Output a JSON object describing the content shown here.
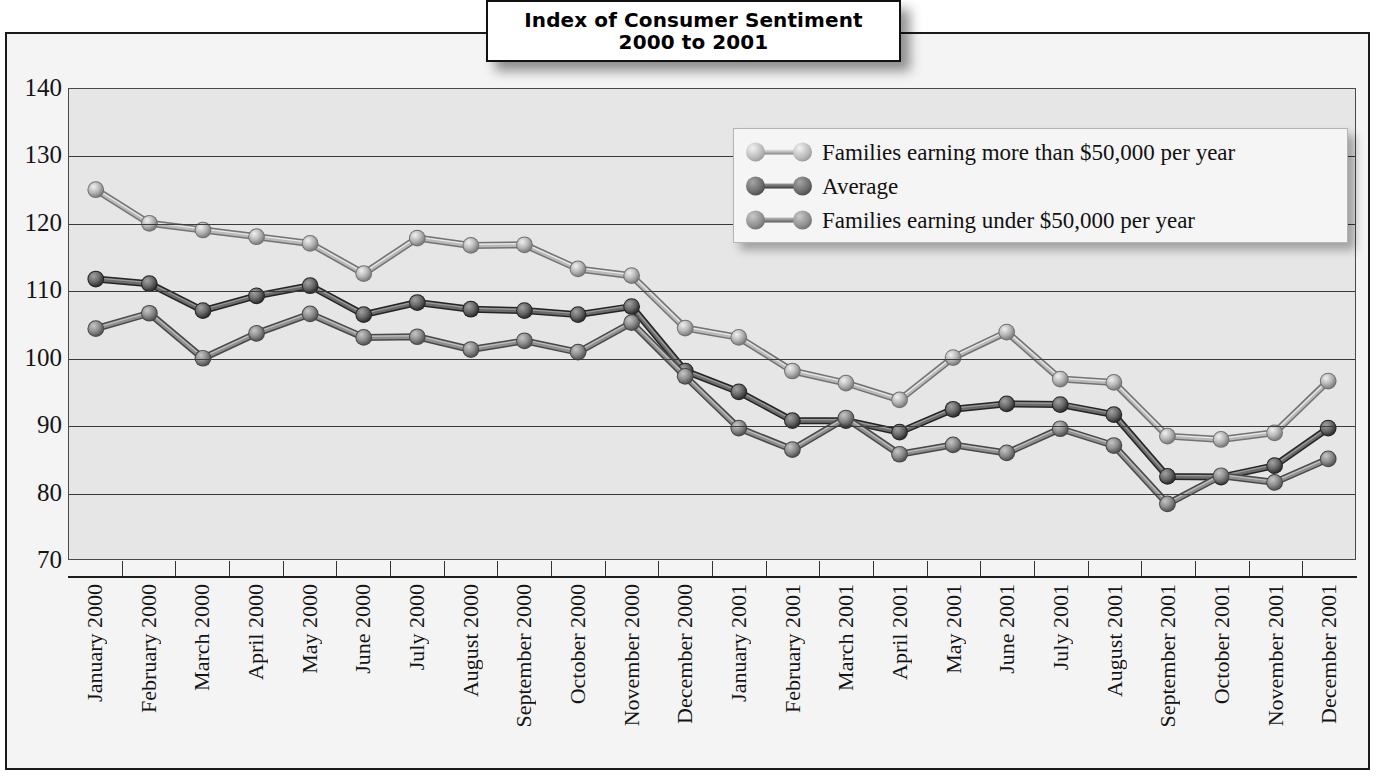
{
  "title": {
    "line1": "Index of Consumer Sentiment",
    "line2": "2000 to 2001"
  },
  "legend": {
    "position": "top-right-inside-plot",
    "items": [
      {
        "label": "Families earning more than $50,000 per year",
        "color": "#b9b9b9",
        "key": "above_50k"
      },
      {
        "label": "Average",
        "color": "#6b6b6b",
        "key": "average"
      },
      {
        "label": "Families earning under $50,000 per year",
        "color": "#8f8f8f",
        "key": "under_50k"
      }
    ]
  },
  "axes": {
    "y_ticks": [
      "140",
      "130",
      "120",
      "110",
      "100",
      "90",
      "80",
      "70"
    ],
    "y_min": 70,
    "y_max": 140,
    "y_step": 10,
    "grid": true
  },
  "chart_data": {
    "type": "line",
    "title": "Index of Consumer Sentiment 2000 to 2001",
    "xlabel": "",
    "ylabel": "",
    "ylim": [
      70,
      140
    ],
    "ytick_step": 10,
    "grid": true,
    "legend_position": "upper right",
    "categories": [
      "January 2000",
      "February 2000",
      "March 2000",
      "April 2000",
      "May 2000",
      "June 2000",
      "July 2000",
      "August 2000",
      "September 2000",
      "October 2000",
      "November 2000",
      "December 2000",
      "January 2001",
      "February 2001",
      "March 2001",
      "April 2001",
      "May 2001",
      "June 2001",
      "July 2001",
      "August 2001",
      "September 2001",
      "October 2001",
      "November 2001",
      "December 2001"
    ],
    "series": [
      {
        "name": "Families earning more than $50,000 per year",
        "color": "#b9b9b9",
        "values": [
          125.0,
          120.0,
          119.0,
          118.0,
          117.0,
          112.5,
          117.8,
          116.7,
          116.8,
          113.2,
          112.2,
          104.4,
          103.0,
          98.0,
          96.2,
          93.7,
          100.0,
          103.8,
          96.8,
          96.3,
          88.3,
          87.8,
          88.8,
          96.5
        ]
      },
      {
        "name": "Average",
        "color": "#6b6b6b",
        "values": [
          111.7,
          111.0,
          107.0,
          109.2,
          110.7,
          106.4,
          108.2,
          107.2,
          107.0,
          106.4,
          107.6,
          98.0,
          94.9,
          90.6,
          90.6,
          88.9,
          92.3,
          93.1,
          93.0,
          91.5,
          82.3,
          82.2,
          83.9,
          89.5
        ]
      },
      {
        "name": "Families earning under $50,000 per year",
        "color": "#8f8f8f",
        "values": [
          104.3,
          106.6,
          99.9,
          103.6,
          106.5,
          103.0,
          103.1,
          101.2,
          102.5,
          100.8,
          105.2,
          97.2,
          89.5,
          86.3,
          91.0,
          85.6,
          87.0,
          85.8,
          89.4,
          86.9,
          78.2,
          82.4,
          81.4,
          84.9
        ]
      }
    ]
  }
}
